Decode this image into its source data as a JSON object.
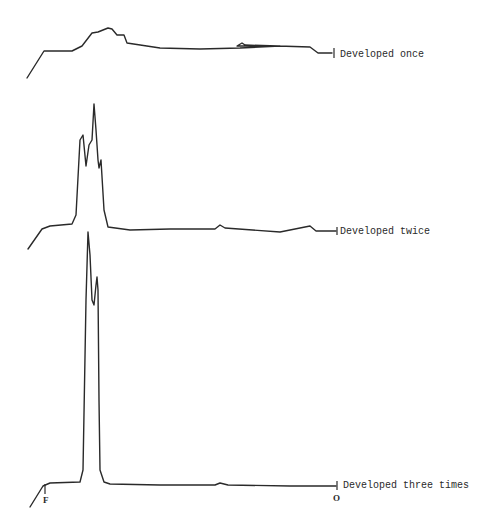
{
  "chart_data": {
    "type": "line",
    "title": "",
    "xlabel": "",
    "ylabel": "",
    "grid": false,
    "legend": "none",
    "x_markers": {
      "front": "F",
      "origin": "O"
    },
    "series": [
      {
        "name": "Developed once",
        "label": "Developed once",
        "points": [
          [
            27,
            78
          ],
          [
            44,
            51
          ],
          [
            72,
            51
          ],
          [
            82,
            46
          ],
          [
            92,
            33
          ],
          [
            98,
            32
          ],
          [
            108,
            28
          ],
          [
            112,
            29
          ],
          [
            117,
            35
          ],
          [
            124,
            35
          ],
          [
            127,
            43
          ],
          [
            160,
            48
          ],
          [
            200,
            49
          ],
          [
            240,
            48
          ],
          [
            280,
            46
          ],
          [
            240,
            46
          ],
          [
            237,
            46
          ],
          [
            242,
            43
          ],
          [
            245,
            45
          ],
          [
            310,
            47
          ],
          [
            318,
            53
          ],
          [
            332,
            53
          ]
        ]
      },
      {
        "name": "Developed twice",
        "label": "Developed twice",
        "points": [
          [
            28,
            249
          ],
          [
            42,
            229
          ],
          [
            50,
            226
          ],
          [
            72,
            224
          ],
          [
            76,
            215
          ],
          [
            80,
            140
          ],
          [
            83,
            135
          ],
          [
            86,
            166
          ],
          [
            89,
            145
          ],
          [
            92,
            140
          ],
          [
            94,
            104
          ],
          [
            96,
            130
          ],
          [
            98,
            160
          ],
          [
            99,
            168
          ],
          [
            101,
            160
          ],
          [
            104,
            210
          ],
          [
            108,
            227
          ],
          [
            130,
            230
          ],
          [
            170,
            229
          ],
          [
            215,
            229
          ],
          [
            220,
            225
          ],
          [
            225,
            228
          ],
          [
            280,
            232
          ],
          [
            310,
            226
          ],
          [
            316,
            231
          ],
          [
            336,
            231
          ]
        ]
      },
      {
        "name": "Developed three times",
        "label": "Developed three times",
        "points": [
          [
            30,
            507
          ],
          [
            43,
            486
          ],
          [
            50,
            483
          ],
          [
            80,
            482
          ],
          [
            83,
            470
          ],
          [
            86,
            300
          ],
          [
            88,
            232
          ],
          [
            90,
            255
          ],
          [
            92,
            300
          ],
          [
            94,
            305
          ],
          [
            96,
            285
          ],
          [
            97,
            277
          ],
          [
            98,
            290
          ],
          [
            99,
            400
          ],
          [
            100,
            470
          ],
          [
            104,
            482
          ],
          [
            110,
            484
          ],
          [
            160,
            485
          ],
          [
            215,
            485
          ],
          [
            220,
            483
          ],
          [
            228,
            485
          ],
          [
            290,
            486
          ],
          [
            336,
            486
          ]
        ]
      }
    ]
  },
  "labels": {
    "once": "Developed once",
    "twice": "Developed twice",
    "three": "Developed three times",
    "front": "F",
    "origin": "O"
  }
}
